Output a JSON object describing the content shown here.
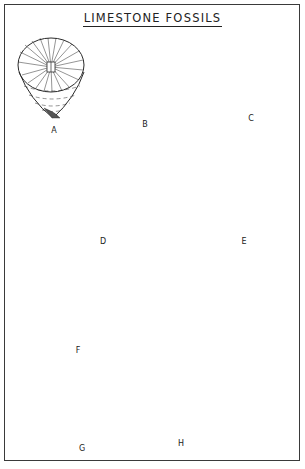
{
  "plate": {
    "title": "LIMESTONE FOSSILS",
    "figures": [
      {
        "id": "A",
        "label": "A",
        "depiction": "horn coral (cup coral, top view with radiating septa)"
      },
      {
        "id": "B",
        "label": "B",
        "depiction": "colonial coral (bundle of tubes)"
      },
      {
        "id": "C",
        "label": "C",
        "depiction": "colonial coral (polygonal corallites)"
      },
      {
        "id": "D",
        "label": "D",
        "depiction": "brachiopod (wide-winged spiriferid)"
      },
      {
        "id": "E",
        "label": "E",
        "depiction": "brachiopod (ribbed shell)"
      },
      {
        "id": "F",
        "label": "F",
        "depiction": "small horn corals (two views)"
      },
      {
        "id": "G",
        "label": "G",
        "depiction": "gastropod / coiled shell"
      },
      {
        "id": "H",
        "label": "H",
        "depiction": "crinoid / large solitary coral column with central opening"
      }
    ]
  },
  "colors": {
    "ink": "#2a2a2a",
    "paper": "#ffffff",
    "border": "#3a3a3a"
  }
}
